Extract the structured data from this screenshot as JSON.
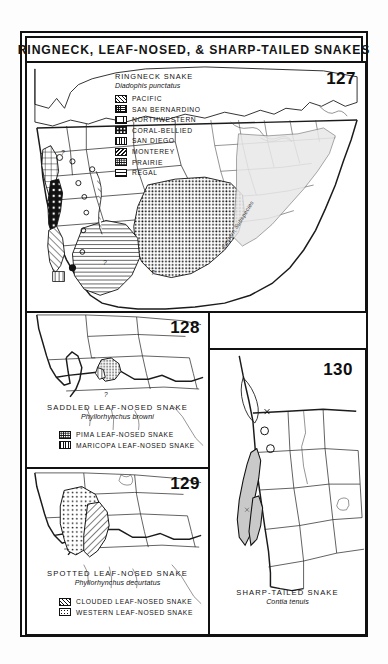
{
  "plate": {
    "title": "RINGNECK, LEAF-NOSED, & SHARP-TAILED SNAKES",
    "background_color": "#fdfdfd",
    "frame_color": "#111111",
    "page_color": "#ffffff"
  },
  "maps": [
    {
      "number": "127",
      "common_name": "RINGNECK SNAKE",
      "scientific_name": "Diadophis punctatus",
      "region": "continental United States",
      "inline_annotations": [
        {
          "text": "Eastern Subspecies",
          "style": "italic-rotated"
        },
        {
          "text": "?",
          "style": "query"
        }
      ],
      "legend": [
        {
          "label": "PACIFIC",
          "pattern": "diagonal-hatch"
        },
        {
          "label": "SAN BERNARDINO",
          "pattern": "fine-grid"
        },
        {
          "label": "NORTHWESTERN",
          "pattern": "coarse-grid"
        },
        {
          "label": "CORAL-BELLIED",
          "pattern": "white-dots-on-black"
        },
        {
          "label": "SAN DIEGO",
          "pattern": "vertical-lines"
        },
        {
          "label": "MONTEREY",
          "pattern": "back-diagonal-hatch"
        },
        {
          "label": "PRAIRIE",
          "pattern": "stipple"
        },
        {
          "label": "REGAL",
          "pattern": "horizontal-lines"
        }
      ]
    },
    {
      "number": "128",
      "common_name": "SADDLED LEAF-NOSED SNAKE",
      "scientific_name": "Phyllorhynchus browni",
      "region": "southwestern United States",
      "legend": [
        {
          "label": "PIMA LEAF-NOSED SNAKE",
          "pattern": "stipple"
        },
        {
          "label": "MARICOPA LEAF-NOSED SNAKE",
          "pattern": "vertical-lines"
        }
      ]
    },
    {
      "number": "129",
      "common_name": "SPOTTED LEAF-NOSED SNAKE",
      "scientific_name": "Phyllorhynchus decurtatus",
      "region": "southwestern United States",
      "legend": [
        {
          "label": "CLOUDED LEAF-NOSED SNAKE",
          "pattern": "diagonal-hatch"
        },
        {
          "label": "WESTERN LEAF-NOSED SNAKE",
          "pattern": "light-dots"
        }
      ]
    },
    {
      "number": "130",
      "common_name": "SHARP-TAILED SNAKE",
      "scientific_name": "Contia tenuis",
      "region": "western United States",
      "legend": []
    }
  ]
}
